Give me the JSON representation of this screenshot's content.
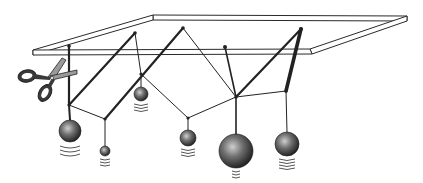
{
  "diagram": {
    "title": "Coupled pendulums hanging from a frame, one string being cut by scissors",
    "colors": {
      "frame_stroke": "#2a2a2a",
      "frame_fill": "#ffffff",
      "string": "#222222",
      "thick_string": "#1a1a1a",
      "ball_light": "#c8c8c8",
      "ball_mid": "#6a6a6a",
      "ball_dark": "#1e1e1e",
      "vibration": "#555555",
      "scissors_handle": "#3a3a3a",
      "scissors_blade": "#9a9a9a"
    },
    "anchors": [
      {
        "id": "a1",
        "x": 69,
        "y": 46
      },
      {
        "id": "a2",
        "x": 135,
        "y": 33
      },
      {
        "id": "a3",
        "x": 183,
        "y": 28
      },
      {
        "id": "a4",
        "x": 225,
        "y": 47
      },
      {
        "id": "a5",
        "x": 301,
        "y": 29
      }
    ],
    "nodes": [
      {
        "id": "n1",
        "x": 69,
        "y": 105
      },
      {
        "id": "n2",
        "x": 105,
        "y": 119
      },
      {
        "id": "n3",
        "x": 141,
        "y": 74
      },
      {
        "id": "n4",
        "x": 188,
        "y": 118
      },
      {
        "id": "n5",
        "x": 236,
        "y": 97
      },
      {
        "id": "n6",
        "x": 286,
        "y": 91
      }
    ],
    "balls": [
      {
        "id": "b1",
        "label": "large ball left",
        "cx": 70,
        "cy": 131,
        "r": 11
      },
      {
        "id": "b2",
        "label": "small ball",
        "cx": 105,
        "cy": 151,
        "r": 5
      },
      {
        "id": "b3",
        "label": "medium-small ball",
        "cx": 141,
        "cy": 94,
        "r": 7
      },
      {
        "id": "b4",
        "label": "medium ball",
        "cx": 188,
        "cy": 138,
        "r": 8
      },
      {
        "id": "b5",
        "label": "largest ball",
        "cx": 236,
        "cy": 151,
        "r": 17
      },
      {
        "id": "b6",
        "label": "large ball right",
        "cx": 287,
        "cy": 144,
        "r": 12
      }
    ],
    "scissors": {
      "label": "scissors cutting left string",
      "x": 18,
      "y": 55
    }
  }
}
